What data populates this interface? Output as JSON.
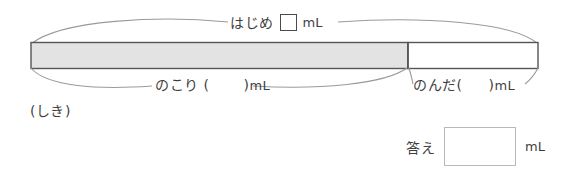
{
  "worksheet": {
    "type": "tape-diagram-problem",
    "width": 562,
    "height": 173
  },
  "diagram": {
    "total_label": {
      "text": "はじめ",
      "unit": "mL",
      "value": "",
      "blank_kind": "square-box"
    },
    "left_segment_label": {
      "text": "のこり",
      "open_paren": "(",
      "value": "",
      "close_paren": ")",
      "unit": "mL"
    },
    "right_segment_label": {
      "text": "のんだ",
      "open_paren": "(",
      "value": "",
      "close_paren": ")",
      "unit": "mL"
    },
    "bar": {
      "fill_color": "#e3e3e3",
      "empty_color": "#ffffff",
      "stroke_color": "#555555",
      "left_fraction": 0.745,
      "right_fraction": 0.255
    }
  },
  "work_area": {
    "label": "(しき)"
  },
  "answer_area": {
    "label": "答え",
    "value": "",
    "unit": "mL",
    "box_border_color": "#b9b9b9"
  }
}
